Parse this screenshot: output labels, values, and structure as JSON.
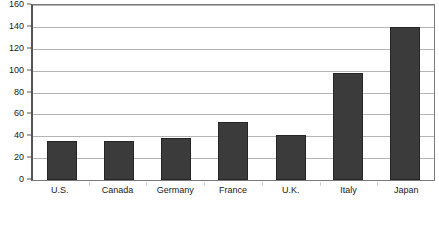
{
  "chart_data": {
    "type": "bar",
    "title": "",
    "subtitle": "",
    "xlabel": "",
    "ylabel": "",
    "categories": [
      "U.S.",
      "Canada",
      "Germany",
      "France",
      "U.K.",
      "Italy",
      "Japan"
    ],
    "values": [
      36,
      36,
      38,
      53,
      41,
      98,
      140
    ],
    "series": [
      {
        "name": "",
        "values": [
          36,
          36,
          38,
          53,
          41,
          98,
          140
        ]
      }
    ],
    "ylim": [
      0,
      160
    ],
    "yticks": [
      0,
      20,
      40,
      60,
      80,
      100,
      120,
      140,
      160
    ],
    "ytick_labels": [
      "0",
      "20",
      "40",
      "60",
      "80",
      "100",
      "120",
      "140",
      "160"
    ],
    "grid": true,
    "grid_axis": "y",
    "legend": false,
    "legend_position": "none",
    "bar_color": "#3b3b3b",
    "bar_edge_color": "#252525",
    "gridline_color": "#b4b4b4",
    "axis_color": "#555555",
    "plot_border_color": "#7a7a7a",
    "background_color": "#ffffff",
    "annotations": []
  }
}
